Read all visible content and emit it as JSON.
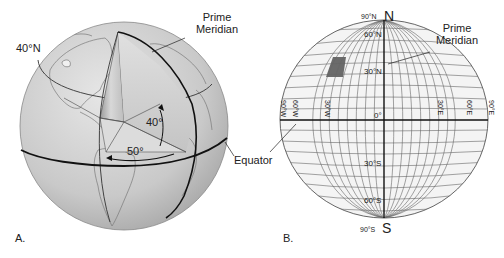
{
  "figure_a": {
    "panel_label": "A.",
    "labels": {
      "lat40": "40°N",
      "prime_meridian_line1": "Prime",
      "prime_meridian_line2": "Meridian",
      "angle_lat": "40°",
      "angle_lon": "50°",
      "equator": "Equator"
    }
  },
  "figure_b": {
    "panel_label": "B.",
    "labels": {
      "pole_north_deg": "90°N",
      "pole_north": "N",
      "pole_south_deg": "90°S",
      "pole_south": "S",
      "lat_60n": "60°N",
      "lat_30n": "30°N",
      "lat_0": "0°",
      "lat_30s": "30°S",
      "lat_60s": "60°S",
      "lon_90w": "90°W",
      "lon_60w": "60°W",
      "lon_30w": "30°W",
      "lon_30e": "30°E",
      "lon_60e": "60°E",
      "lon_90e": "90°E",
      "prime_meridian_line1": "Prime",
      "prime_meridian_line2": "Meridian"
    },
    "highlight_color": "#6b6b6b"
  },
  "colors": {
    "globe_fill": "#d4d4d4",
    "grid_fill": "#f4f4f4",
    "line": "#1a1a1a"
  }
}
